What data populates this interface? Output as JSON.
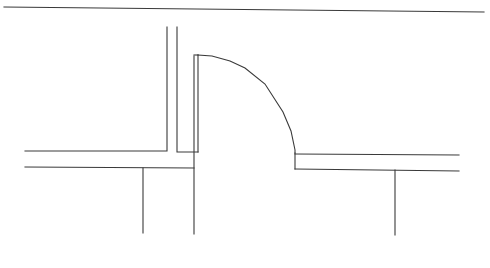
{
  "diagram": {
    "type": "floor-plan-door-detail",
    "width": 490,
    "height": 268,
    "background": "#ffffff",
    "stroke_color": "#3a3a3a",
    "stroke_width": 1.1,
    "top_line": {
      "x1": 4,
      "y1": 7,
      "x2": 484,
      "y2": 12
    },
    "left_wall": {
      "polyline": [
        [
          167,
          27
        ],
        [
          167,
          151
        ],
        [
          25,
          151
        ]
      ],
      "lower_line": [
        [
          25,
          167
        ],
        [
          194,
          168
        ]
      ],
      "post": [
        [
          143,
          168
        ],
        [
          143,
          233
        ]
      ]
    },
    "jamb": {
      "polyline": [
        [
          177,
          27
        ],
        [
          177,
          152
        ],
        [
          198,
          152
        ]
      ]
    },
    "door_leaf": {
      "outer": [
        [
          194,
          56
        ],
        [
          194,
          234
        ]
      ],
      "inner": [
        [
          198,
          55
        ],
        [
          198,
          152
        ]
      ],
      "top": [
        [
          194,
          55
        ],
        [
          198,
          55
        ]
      ]
    },
    "door_swing_arc": {
      "points": [
        [
          198,
          55
        ],
        [
          212,
          56
        ],
        [
          230,
          61
        ],
        [
          245,
          68
        ],
        [
          265,
          84
        ],
        [
          283,
          112
        ],
        [
          291,
          131
        ],
        [
          295,
          150
        ],
        [
          295,
          153
        ]
      ]
    },
    "right_wall": {
      "stub": [
        [
          295,
          153
        ],
        [
          295,
          169
        ]
      ],
      "upper_line": [
        [
          295,
          154
        ],
        [
          459,
          155
        ]
      ],
      "lower_line": [
        [
          295,
          169
        ],
        [
          459,
          171
        ]
      ],
      "post": [
        [
          395,
          170
        ],
        [
          395,
          235
        ]
      ]
    }
  }
}
